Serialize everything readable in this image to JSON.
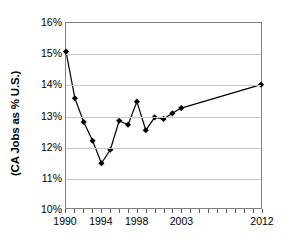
{
  "chart_data": {
    "type": "line",
    "title": "",
    "xlabel": "",
    "ylabel": "(CA Jobs as % U.S.)",
    "xlim": [
      1990,
      2012
    ],
    "ylim": [
      10,
      16
    ],
    "grid": true,
    "legend": null,
    "marker": "diamond",
    "line_color": "#000000",
    "marker_color": "#000000",
    "grid_color": "#c8c8c8",
    "axis_color": "#808080",
    "y_ticks": [
      {
        "value": 16,
        "label": "16%"
      },
      {
        "value": 15,
        "label": "15%"
      },
      {
        "value": 14,
        "label": "14%"
      },
      {
        "value": 13,
        "label": "13%"
      },
      {
        "value": 12,
        "label": "12%"
      },
      {
        "value": 11,
        "label": "11%"
      },
      {
        "value": 10,
        "label": "10%"
      }
    ],
    "x_tick_years": [
      1990,
      1991,
      1992,
      1993,
      1994,
      1995,
      1996,
      1997,
      1998,
      1999,
      2000,
      2001,
      2002,
      2003,
      2004,
      2005,
      2006,
      2007,
      2008,
      2009,
      2010,
      2011,
      2012
    ],
    "x_tick_labels": [
      {
        "value": 1990,
        "label": "1990"
      },
      {
        "value": 1994,
        "label": "1994"
      },
      {
        "value": 1998,
        "label": "1998"
      },
      {
        "value": 2003,
        "label": "2003"
      },
      {
        "value": 2012,
        "label": "2012"
      }
    ],
    "x": [
      1990,
      1991,
      1992,
      1993,
      1994,
      1995,
      1996,
      1997,
      1998,
      1999,
      2000,
      2001,
      2002,
      2003,
      2012
    ],
    "values": [
      15.07,
      13.56,
      12.79,
      12.18,
      11.45,
      11.89,
      12.83,
      12.7,
      13.45,
      12.52,
      12.94,
      12.89,
      13.07,
      13.24,
      14.0
    ],
    "series": [
      {
        "name": "CA Jobs as % U.S.",
        "x": [
          1990,
          1991,
          1992,
          1993,
          1994,
          1995,
          1996,
          1997,
          1998,
          1999,
          2000,
          2001,
          2002,
          2003,
          2012
        ],
        "values": [
          15.07,
          13.56,
          12.79,
          12.18,
          11.45,
          11.89,
          12.83,
          12.7,
          13.45,
          12.52,
          12.94,
          12.89,
          13.07,
          13.24,
          14.0
        ]
      }
    ]
  }
}
